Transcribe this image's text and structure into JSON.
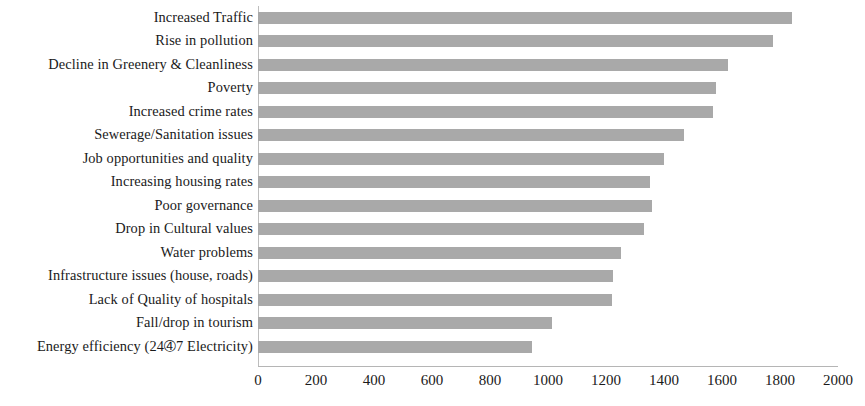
{
  "chart_data": {
    "type": "bar",
    "orientation": "horizontal",
    "title": "",
    "subtitle": "",
    "xlabel": "",
    "ylabel": "",
    "xlim": [
      0,
      2000
    ],
    "xticks": [
      0,
      200,
      400,
      600,
      800,
      1000,
      1200,
      1400,
      1600,
      1800,
      2000
    ],
    "xtick_labels": [
      "0",
      "200",
      "400",
      "600",
      "800",
      "1000",
      "1200",
      "1400",
      "1600",
      "1800",
      "2000"
    ],
    "grid": false,
    "legend": null,
    "bar_color": "#a9a9a9",
    "axis_color": "#bdbdbd",
    "categories": [
      "Increased Traffic",
      "Rise in pollution",
      "Decline in Greenery & Cleanliness",
      "Poverty",
      "Increased crime rates",
      "Sewerage/Sanitation issues",
      "Job opportunities and quality",
      "Increasing housing rates",
      "Poor governance",
      "Drop in Cultural values",
      "Water problems",
      "Infrastructure issues (house, roads)",
      "Lack of Quality of hospitals",
      "Fall/drop in tourism",
      "Energy efficiency (24➃7 Electricity)"
    ],
    "values": [
      1840,
      1775,
      1620,
      1580,
      1570,
      1470,
      1400,
      1350,
      1360,
      1330,
      1250,
      1225,
      1220,
      1015,
      945
    ]
  }
}
